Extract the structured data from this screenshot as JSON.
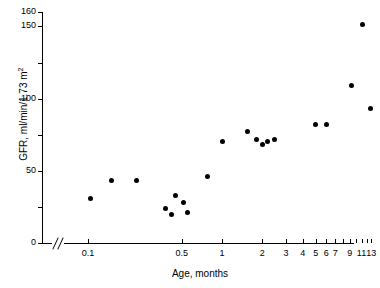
{
  "chart_data": {
    "type": "scatter",
    "title": "",
    "xlabel": "Age, months",
    "ylabel": "GFR, ml/min/1.73 m2",
    "ylabel_html": "GFR, ml/min/1.73 m",
    "ylabel_sup": "2",
    "x_scale": "log",
    "y_scale": "linear",
    "grid": false,
    "legend": false,
    "axis_break_x": true,
    "xlim": [
      0.085,
      14.5
    ],
    "ylim": [
      0,
      160
    ],
    "yticks": [
      0,
      25,
      50,
      75,
      100,
      125,
      150,
      160
    ],
    "ytick_labels": [
      "0",
      "",
      "50",
      "",
      "100",
      "",
      "150",
      "160"
    ],
    "xticks": [
      0.1,
      0.5,
      1,
      2,
      3,
      4,
      5,
      6,
      7,
      8,
      9,
      10,
      11,
      12,
      13
    ],
    "xtick_labels": [
      "0.1",
      "0.5",
      "1",
      "2",
      "3",
      "4",
      "5",
      "6",
      "7",
      "",
      "9",
      "",
      "11",
      "",
      "13"
    ],
    "x": [
      0.105,
      0.15,
      0.23,
      0.38,
      0.42,
      0.45,
      0.52,
      0.55,
      0.78,
      1.0,
      1.55,
      1.8,
      2.0,
      2.2,
      2.45,
      5.0,
      6.0,
      9.2,
      11.2,
      12.8
    ],
    "y": [
      31,
      43,
      43,
      24,
      20,
      33,
      28,
      21,
      46,
      70,
      77,
      72,
      68,
      70,
      72,
      82,
      82,
      109,
      151,
      93
    ],
    "points": [
      {
        "x": 0.105,
        "y": 31
      },
      {
        "x": 0.15,
        "y": 43
      },
      {
        "x": 0.23,
        "y": 43
      },
      {
        "x": 0.38,
        "y": 24
      },
      {
        "x": 0.42,
        "y": 20
      },
      {
        "x": 0.45,
        "y": 33
      },
      {
        "x": 0.52,
        "y": 28
      },
      {
        "x": 0.55,
        "y": 21
      },
      {
        "x": 0.78,
        "y": 46
      },
      {
        "x": 1.0,
        "y": 70
      },
      {
        "x": 1.55,
        "y": 77
      },
      {
        "x": 1.8,
        "y": 72
      },
      {
        "x": 2.0,
        "y": 68
      },
      {
        "x": 2.2,
        "y": 70
      },
      {
        "x": 2.45,
        "y": 72
      },
      {
        "x": 5.0,
        "y": 82
      },
      {
        "x": 6.0,
        "y": 82
      },
      {
        "x": 9.2,
        "y": 109
      },
      {
        "x": 11.2,
        "y": 151
      },
      {
        "x": 12.8,
        "y": 93
      }
    ],
    "marker": {
      "shape": "circle",
      "color": "#000000",
      "size": 5
    },
    "colors": {
      "axis": "#000000",
      "marker": "#000000",
      "background": "#ffffff"
    }
  }
}
